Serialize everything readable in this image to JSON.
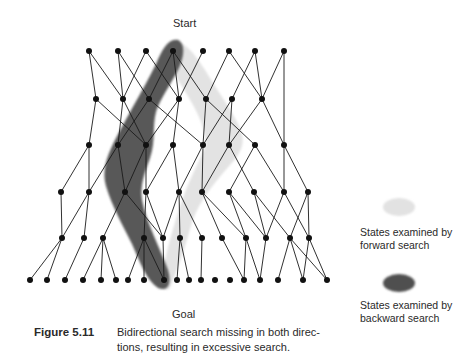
{
  "diagram": {
    "start_label": "Start",
    "goal_label": "Goal",
    "colors": {
      "node": "#111111",
      "edge": "#1a1a1a",
      "forward_region": "#e2e2e2",
      "backward_region": "#555555"
    },
    "levels": [
      {
        "y": 51,
        "x": [
          89,
          118,
          146,
          173,
          203,
          229,
          255,
          284
        ]
      },
      {
        "y": 99,
        "x": [
          96,
          123,
          149,
          179,
          206,
          232,
          262
        ]
      },
      {
        "y": 145,
        "x": [
          89,
          118,
          146,
          173,
          203,
          229,
          255,
          284
        ]
      },
      {
        "y": 192,
        "x": [
          61,
          89,
          125,
          146,
          179,
          202,
          229,
          254,
          284,
          308
        ]
      },
      {
        "y": 238,
        "x": [
          62,
          84,
          103,
          144,
          163,
          180,
          202,
          222,
          246,
          266,
          290,
          309
        ]
      },
      {
        "y": 280,
        "x": [
          30,
          47,
          65,
          83,
          101,
          116,
          128,
          144,
          164,
          177,
          189,
          201,
          215,
          230,
          244,
          260,
          278,
          303,
          327
        ]
      }
    ],
    "edges": [
      [
        [
          0,
          0
        ],
        [
          1,
          0
        ]
      ],
      [
        [
          0,
          0
        ],
        [
          1,
          1
        ]
      ],
      [
        [
          0,
          1
        ],
        [
          1,
          1
        ]
      ],
      [
        [
          0,
          1
        ],
        [
          1,
          2
        ]
      ],
      [
        [
          0,
          2
        ],
        [
          1,
          1
        ]
      ],
      [
        [
          0,
          2
        ],
        [
          1,
          3
        ]
      ],
      [
        [
          0,
          3
        ],
        [
          1,
          2
        ]
      ],
      [
        [
          0,
          3
        ],
        [
          1,
          3
        ]
      ],
      [
        [
          0,
          3
        ],
        [
          1,
          4
        ]
      ],
      [
        [
          0,
          4
        ],
        [
          1,
          3
        ]
      ],
      [
        [
          0,
          5
        ],
        [
          1,
          4
        ]
      ],
      [
        [
          0,
          5
        ],
        [
          1,
          6
        ]
      ],
      [
        [
          0,
          6
        ],
        [
          1,
          5
        ]
      ],
      [
        [
          0,
          6
        ],
        [
          1,
          6
        ]
      ],
      [
        [
          0,
          7
        ],
        [
          1,
          6
        ]
      ],
      [
        [
          1,
          0
        ],
        [
          2,
          0
        ]
      ],
      [
        [
          1,
          0
        ],
        [
          2,
          2
        ]
      ],
      [
        [
          1,
          1
        ],
        [
          2,
          1
        ]
      ],
      [
        [
          1,
          1
        ],
        [
          2,
          2
        ]
      ],
      [
        [
          1,
          2
        ],
        [
          2,
          1
        ]
      ],
      [
        [
          1,
          2
        ],
        [
          2,
          4
        ]
      ],
      [
        [
          1,
          3
        ],
        [
          2,
          2
        ]
      ],
      [
        [
          1,
          3
        ],
        [
          2,
          3
        ]
      ],
      [
        [
          1,
          4
        ],
        [
          2,
          4
        ]
      ],
      [
        [
          1,
          4
        ],
        [
          2,
          6
        ]
      ],
      [
        [
          1,
          5
        ],
        [
          2,
          4
        ]
      ],
      [
        [
          1,
          5
        ],
        [
          2,
          5
        ]
      ],
      [
        [
          1,
          6
        ],
        [
          2,
          5
        ]
      ],
      [
        [
          1,
          6
        ],
        [
          2,
          7
        ]
      ],
      [
        [
          0,
          7
        ],
        [
          2,
          7
        ]
      ],
      [
        [
          2,
          0
        ],
        [
          3,
          0
        ]
      ],
      [
        [
          2,
          0
        ],
        [
          3,
          1
        ]
      ],
      [
        [
          2,
          1
        ],
        [
          3,
          1
        ]
      ],
      [
        [
          2,
          1
        ],
        [
          3,
          2
        ]
      ],
      [
        [
          2,
          2
        ],
        [
          3,
          2
        ]
      ],
      [
        [
          2,
          2
        ],
        [
          3,
          3
        ]
      ],
      [
        [
          2,
          3
        ],
        [
          3,
          3
        ]
      ],
      [
        [
          2,
          3
        ],
        [
          3,
          4
        ]
      ],
      [
        [
          2,
          4
        ],
        [
          3,
          4
        ]
      ],
      [
        [
          2,
          4
        ],
        [
          3,
          5
        ]
      ],
      [
        [
          2,
          5
        ],
        [
          3,
          5
        ]
      ],
      [
        [
          2,
          5
        ],
        [
          3,
          7
        ]
      ],
      [
        [
          2,
          6
        ],
        [
          3,
          6
        ]
      ],
      [
        [
          2,
          6
        ],
        [
          3,
          8
        ]
      ],
      [
        [
          2,
          7
        ],
        [
          3,
          8
        ]
      ],
      [
        [
          2,
          7
        ],
        [
          3,
          9
        ]
      ],
      [
        [
          3,
          0
        ],
        [
          4,
          0
        ]
      ],
      [
        [
          3,
          1
        ],
        [
          4,
          0
        ]
      ],
      [
        [
          3,
          1
        ],
        [
          4,
          1
        ]
      ],
      [
        [
          3,
          2
        ],
        [
          4,
          2
        ]
      ],
      [
        [
          3,
          2
        ],
        [
          4,
          4
        ]
      ],
      [
        [
          3,
          3
        ],
        [
          4,
          3
        ]
      ],
      [
        [
          3,
          3
        ],
        [
          4,
          4
        ]
      ],
      [
        [
          3,
          4
        ],
        [
          4,
          4
        ]
      ],
      [
        [
          3,
          4
        ],
        [
          4,
          5
        ]
      ],
      [
        [
          3,
          4
        ],
        [
          4,
          6
        ]
      ],
      [
        [
          3,
          5
        ],
        [
          4,
          7
        ]
      ],
      [
        [
          3,
          5
        ],
        [
          4,
          8
        ]
      ],
      [
        [
          3,
          6
        ],
        [
          4,
          8
        ]
      ],
      [
        [
          3,
          6
        ],
        [
          4,
          9
        ]
      ],
      [
        [
          3,
          7
        ],
        [
          4,
          9
        ]
      ],
      [
        [
          3,
          7
        ],
        [
          4,
          10
        ]
      ],
      [
        [
          3,
          8
        ],
        [
          4,
          9
        ]
      ],
      [
        [
          3,
          8
        ],
        [
          4,
          11
        ]
      ],
      [
        [
          3,
          9
        ],
        [
          4,
          10
        ]
      ],
      [
        [
          3,
          9
        ],
        [
          4,
          11
        ]
      ],
      [
        [
          4,
          0
        ],
        [
          5,
          0
        ]
      ],
      [
        [
          4,
          0
        ],
        [
          5,
          1
        ]
      ],
      [
        [
          4,
          1
        ],
        [
          5,
          2
        ]
      ],
      [
        [
          4,
          2
        ],
        [
          5,
          3
        ]
      ],
      [
        [
          4,
          2
        ],
        [
          5,
          4
        ]
      ],
      [
        [
          4,
          2
        ],
        [
          5,
          5
        ]
      ],
      [
        [
          4,
          3
        ],
        [
          5,
          6
        ]
      ],
      [
        [
          4,
          3
        ],
        [
          5,
          7
        ]
      ],
      [
        [
          4,
          3
        ],
        [
          5,
          8
        ]
      ],
      [
        [
          4,
          4
        ],
        [
          5,
          8
        ]
      ],
      [
        [
          4,
          5
        ],
        [
          5,
          9
        ]
      ],
      [
        [
          4,
          5
        ],
        [
          5,
          10
        ]
      ],
      [
        [
          4,
          6
        ],
        [
          5,
          11
        ]
      ],
      [
        [
          4,
          7
        ],
        [
          5,
          14
        ]
      ],
      [
        [
          4,
          8
        ],
        [
          5,
          14
        ]
      ],
      [
        [
          4,
          8
        ],
        [
          5,
          15
        ]
      ],
      [
        [
          4,
          9
        ],
        [
          5,
          15
        ]
      ],
      [
        [
          4,
          10
        ],
        [
          5,
          16
        ]
      ],
      [
        [
          4,
          10
        ],
        [
          5,
          17
        ]
      ],
      [
        [
          4,
          10
        ],
        [
          5,
          18
        ]
      ],
      [
        [
          4,
          11
        ],
        [
          5,
          17
        ]
      ],
      [
        [
          4,
          11
        ],
        [
          5,
          18
        ]
      ]
    ]
  },
  "legend": {
    "forward": {
      "line1": "States examined by",
      "line2": "forward search"
    },
    "backward": {
      "line1": "States examined by",
      "line2": "backward search"
    }
  },
  "caption": {
    "figure_number": "Figure 5.11",
    "line1": "Bidirectional search missing in both direc-",
    "line2": "tions, resulting in excessive search."
  }
}
